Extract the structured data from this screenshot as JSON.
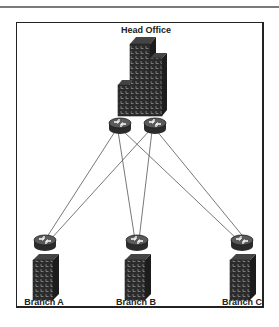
{
  "diagram": {
    "type": "network-topology",
    "head_office": {
      "label": "Head Office",
      "icon": "office-tower-icon",
      "routers": [
        {
          "id": "ho-router-1",
          "icon": "router-icon"
        },
        {
          "id": "ho-router-2",
          "icon": "router-icon"
        }
      ]
    },
    "branches": [
      {
        "id": "branch-a",
        "label": "Branch A",
        "icon": "building-icon",
        "router_icon": "router-icon"
      },
      {
        "id": "branch-b",
        "label": "Branch B",
        "icon": "building-icon",
        "router_icon": "router-icon"
      },
      {
        "id": "branch-c",
        "label": "Branch C",
        "icon": "building-icon",
        "router_icon": "router-icon"
      }
    ],
    "links": [
      {
        "from": "ho-router-1",
        "to": "branch-a"
      },
      {
        "from": "ho-router-1",
        "to": "branch-b"
      },
      {
        "from": "ho-router-1",
        "to": "branch-c"
      },
      {
        "from": "ho-router-2",
        "to": "branch-a"
      },
      {
        "from": "ho-router-2",
        "to": "branch-b"
      },
      {
        "from": "ho-router-2",
        "to": "branch-c"
      }
    ],
    "colors": {
      "line": "#555555",
      "icon": "#2b2b2b",
      "frame": "#222222"
    }
  }
}
